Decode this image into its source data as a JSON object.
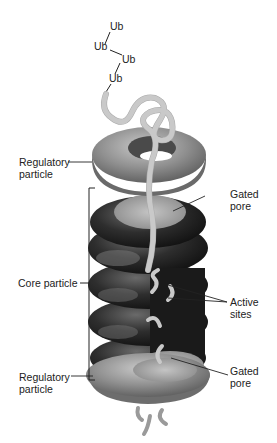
{
  "figure": {
    "ubiquitin_chain": [
      "Ub",
      "Ub",
      "Ub",
      "Ub"
    ],
    "labels": {
      "regulatory_top": [
        "Regulatory",
        "particle"
      ],
      "gated_pore_top": [
        "Gated",
        "pore"
      ],
      "core_particle": "Core particle",
      "active_sites": [
        "Active",
        "sites"
      ],
      "gated_pore_bottom": [
        "Gated",
        "pore"
      ],
      "regulatory_bottom": [
        "Regulatory",
        "particle"
      ]
    },
    "colors": {
      "regulatory_ring": "#8f8f8f",
      "core_ring": "#2a2a2a",
      "pore": "#b5b5b5",
      "polypeptide": "#c9c9c9",
      "leader_line": "#222222"
    }
  }
}
